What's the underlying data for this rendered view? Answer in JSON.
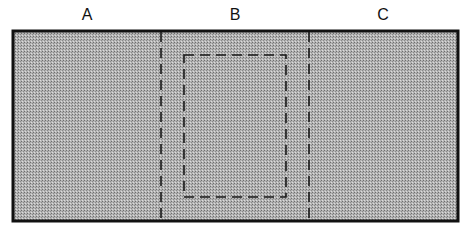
{
  "diagram": {
    "title": "",
    "panels": [
      {
        "id": "A",
        "label": "A",
        "x_center": 87
      },
      {
        "id": "B",
        "label": "B",
        "x_center": 235
      },
      {
        "id": "C",
        "label": "C",
        "x_center": 383
      }
    ],
    "outer_rect": {
      "x": 13,
      "y": 31,
      "width": 445,
      "height": 190,
      "stroke": "#111111",
      "fill_pattern": "fine-dot-gray"
    },
    "dividers": [
      {
        "x": 161,
        "style": "dashed"
      },
      {
        "x": 309,
        "style": "dashed"
      }
    ],
    "inner_rect": {
      "x": 184,
      "y": 55,
      "width": 102,
      "height": 142,
      "style": "dashed"
    },
    "colors": {
      "fill": "#a6a6a6",
      "dot_dark": "#7a7a7a",
      "dot_light": "#c8c8c8",
      "stroke": "#111111",
      "background": "#ffffff"
    }
  }
}
